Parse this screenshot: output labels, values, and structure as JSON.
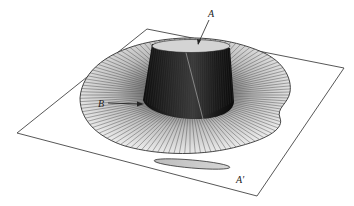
{
  "figure": {
    "labels": {
      "A": "A",
      "B": "B",
      "A_prime": "A′"
    },
    "colors": {
      "background": "#ffffff",
      "plane_stroke": "#444444",
      "cylinder_dark": "#1a1a1a",
      "cylinder_top": "#d8d8d8",
      "ruling_lines": "#555555",
      "shadow_fill": "#c8c8c8"
    }
  }
}
